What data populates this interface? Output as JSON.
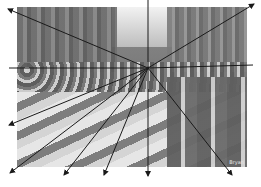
{
  "figure": {
    "photo": {
      "x": 17,
      "y": 7,
      "width": 230,
      "height": 160,
      "caption": "Bryan"
    },
    "vanishing_point": {
      "x": 148,
      "y": 68
    },
    "line_color": "#1a1a1a",
    "lines": [
      {
        "name": "up-left",
        "x2": 8,
        "y2": 9,
        "arrow": true
      },
      {
        "name": "left-horizon",
        "x2": 9,
        "y2": 68,
        "arrow": false
      },
      {
        "name": "right-horizon",
        "x2": 253,
        "y2": 65,
        "arrow": false
      },
      {
        "name": "up-vertical",
        "x2": 148,
        "y2": 0,
        "arrow": false
      },
      {
        "name": "up-right",
        "x2": 254,
        "y2": 4,
        "arrow": true
      },
      {
        "name": "down-left-1",
        "x2": 9,
        "y2": 125,
        "arrow": true
      },
      {
        "name": "down-left-2",
        "x2": 10,
        "y2": 173,
        "arrow": true
      },
      {
        "name": "down-left-3",
        "x2": 64,
        "y2": 175,
        "arrow": true
      },
      {
        "name": "down-left-4",
        "x2": 104,
        "y2": 175,
        "arrow": true
      },
      {
        "name": "down-vertical",
        "x2": 148,
        "y2": 176,
        "arrow": true
      },
      {
        "name": "down-right",
        "x2": 232,
        "y2": 175,
        "arrow": true
      }
    ]
  }
}
